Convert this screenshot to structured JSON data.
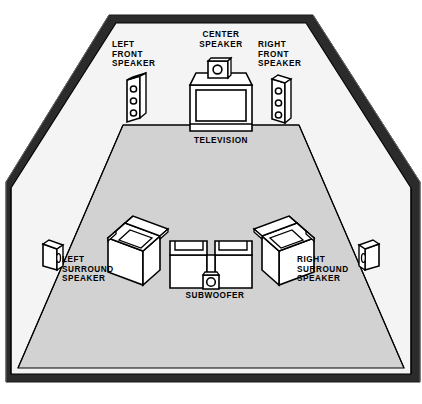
{
  "diagram": {
    "type": "room-layout",
    "colors": {
      "wall_outline": "#2b2b2b",
      "wall_face": "#f4f4f4",
      "floor": "#d2d2d2",
      "object_fill": "#ffffff",
      "object_outline": "#000000",
      "text": "#000000"
    },
    "labels": {
      "left_front_speaker": "LEFT\nFRONT\nSPEAKER",
      "center_speaker": "CENTER\nSPEAKER",
      "right_front_speaker": "RIGHT\nFRONT\nSPEAKER",
      "television": "TELEVISION",
      "left_surround_speaker": "LEFT\nSURROUND\nSPEAKER",
      "right_surround_speaker": "RIGHT\nSURROUND\nSPEAKER",
      "subwoofer": "SUBWOOFER"
    },
    "objects": [
      {
        "name": "left-front-speaker",
        "kind": "tower-speaker",
        "drivers": 3,
        "wall": "front-left"
      },
      {
        "name": "center-speaker",
        "kind": "center-speaker",
        "drivers": 1,
        "position": "on-television"
      },
      {
        "name": "right-front-speaker",
        "kind": "tower-speaker",
        "drivers": 3,
        "wall": "front-right"
      },
      {
        "name": "television",
        "kind": "crt-television",
        "position": "front-center"
      },
      {
        "name": "left-surround-speaker",
        "kind": "bookshelf-speaker",
        "drivers": 1,
        "wall": "side-left"
      },
      {
        "name": "right-surround-speaker",
        "kind": "bookshelf-speaker",
        "drivers": 1,
        "wall": "side-right"
      },
      {
        "name": "subwoofer",
        "kind": "subwoofer",
        "drivers": 1,
        "position": "between-seats"
      },
      {
        "name": "left-armchair",
        "kind": "armchair",
        "position": "rear-left"
      },
      {
        "name": "right-armchair",
        "kind": "armchair",
        "position": "rear-right"
      },
      {
        "name": "left-seat",
        "kind": "seat",
        "position": "rear-center-left"
      },
      {
        "name": "right-seat",
        "kind": "seat",
        "position": "rear-center-right"
      }
    ]
  }
}
